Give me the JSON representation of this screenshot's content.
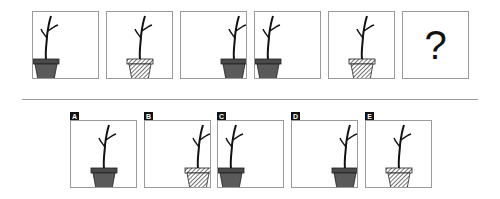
{
  "puzzle": {
    "sequence": [
      {
        "id": 1,
        "pot": "solid",
        "position": "left",
        "x": 32,
        "y": 11
      },
      {
        "id": 2,
        "pot": "hatched",
        "position": "center",
        "x": 106,
        "y": 11
      },
      {
        "id": 3,
        "pot": "solid",
        "position": "right",
        "x": 180,
        "y": 11
      },
      {
        "id": 4,
        "pot": "solid",
        "position": "left",
        "x": 254,
        "y": 11
      },
      {
        "id": 5,
        "pot": "hatched",
        "position": "center",
        "x": 328,
        "y": 11
      },
      {
        "id": 6,
        "unknown": true,
        "symbol": "?",
        "x": 402,
        "y": 11
      }
    ],
    "question_mark": "?",
    "options": [
      {
        "label": "A",
        "pot": "solid",
        "position": "center",
        "x": 70,
        "y": 120
      },
      {
        "label": "B",
        "pot": "hatched",
        "position": "right",
        "x": 144,
        "y": 120
      },
      {
        "label": "C",
        "pot": "solid",
        "position": "left",
        "x": 217,
        "y": 120
      },
      {
        "label": "D",
        "pot": "solid",
        "position": "right",
        "x": 291,
        "y": 120
      },
      {
        "label": "E",
        "pot": "hatched",
        "position": "center",
        "x": 365,
        "y": 120
      }
    ]
  },
  "colors": {
    "pot_solid": "#5a5a5a",
    "pot_rim": "#4a4a4a",
    "stem": "#111111",
    "border": "#9a9a9a"
  }
}
